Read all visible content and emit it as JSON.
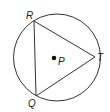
{
  "diagram": {
    "type": "inscribed-triangle-in-circle",
    "circle": {
      "cx": 57,
      "cy": 57.5,
      "r": 43.5,
      "stroke": "#333333"
    },
    "center_point": {
      "label": "P",
      "x": 54,
      "y": 58
    },
    "vertices": [
      {
        "label": "R",
        "x": 34,
        "y": 21
      },
      {
        "label": "T",
        "x": 95,
        "y": 57
      },
      {
        "label": "Q",
        "x": 36,
        "y": 96
      }
    ],
    "edges": [
      [
        "R",
        "T"
      ],
      [
        "T",
        "Q"
      ],
      [
        "Q",
        "R"
      ]
    ],
    "labels": {
      "R": "R",
      "T": "T",
      "Q": "Q",
      "P": "P"
    }
  }
}
